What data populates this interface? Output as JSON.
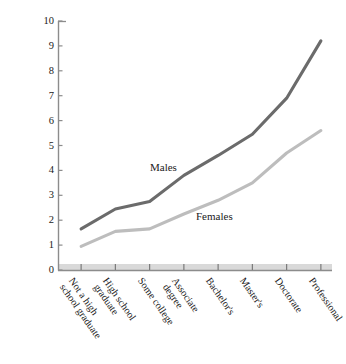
{
  "chart_data": {
    "type": "line",
    "title": "",
    "subtitle": "",
    "xlabel": "",
    "ylabel": "Income in thousands of dollars per month",
    "categories": [
      "Not a high\nschool graduate",
      "High school\ngraduate",
      "Some college",
      "Associate\ndegree",
      "Bachelor's",
      "Master's",
      "Doctorate",
      "Professional"
    ],
    "series": [
      {
        "name": "Males",
        "color": "#6b6b6b",
        "values": [
          1.65,
          2.45,
          2.75,
          3.8,
          4.6,
          5.45,
          6.9,
          9.2
        ]
      },
      {
        "name": "Females",
        "color": "#bdbdbd",
        "values": [
          0.95,
          1.55,
          1.65,
          2.25,
          2.8,
          3.5,
          4.7,
          5.6
        ]
      }
    ],
    "ylim": [
      0,
      10
    ],
    "y_ticks": [
      0,
      1,
      2,
      3,
      4,
      5,
      6,
      7,
      8,
      9,
      10
    ],
    "y_tick_labels": [
      "0",
      "1",
      "2",
      "3",
      "4",
      "5",
      "6",
      "7",
      "8",
      "9",
      "10"
    ],
    "grid": false,
    "legend_position": "inline-annotations",
    "annotations": [
      {
        "text": "Males",
        "series": "Males"
      },
      {
        "text": "Females",
        "series": "Females"
      }
    ],
    "axis_color": "#8c8c8c",
    "baseline_band_color": "#d9d9d9"
  }
}
